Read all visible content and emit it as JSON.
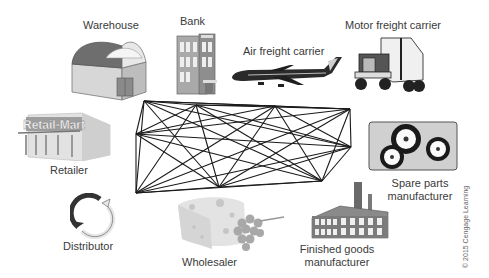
{
  "diagram": {
    "title": "",
    "nodes": [
      {
        "id": "warehouse",
        "label": "Warehouse",
        "icon": "warehouse-icon"
      },
      {
        "id": "bank",
        "label": "Bank",
        "icon": "bank-building-icon"
      },
      {
        "id": "air",
        "label": "Air freight carrier",
        "icon": "airplane-icon"
      },
      {
        "id": "motor",
        "label": "Motor freight carrier",
        "icon": "truck-icon"
      },
      {
        "id": "retailer",
        "label": "Retailer",
        "icon": "retail-store-icon",
        "sign_text": "Retail-Mart"
      },
      {
        "id": "spare",
        "label_line1": "Spare parts",
        "label_line2": "manufacturer",
        "icon": "gears-icon"
      },
      {
        "id": "distributor",
        "label": "Distributor",
        "icon": "cycle-arrows-icon"
      },
      {
        "id": "wholesaler",
        "label": "Wholesaler",
        "icon": "cheese-grapes-icon"
      },
      {
        "id": "finished",
        "label_line1": "Finished goods",
        "label_line2": "manufacturer",
        "icon": "factory-icon"
      }
    ],
    "network_points": [
      [
        144,
        101
      ],
      [
        196,
        105
      ],
      [
        275,
        106
      ],
      [
        350,
        109
      ],
      [
        136,
        134
      ],
      [
        351,
        147
      ],
      [
        136,
        193
      ],
      [
        219,
        187
      ],
      [
        322,
        181
      ]
    ],
    "edge_style": "complete-graph",
    "line_color": "#1a1a1a",
    "copyright": "© 2015 Cengage Learning"
  }
}
